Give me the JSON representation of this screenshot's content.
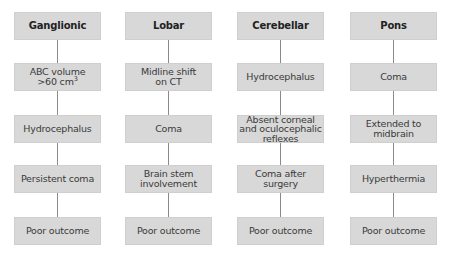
{
  "diagram": {
    "type": "flowchart",
    "columns": [
      {
        "header": "Ganglionic",
        "steps": [
          "ABC volume >60 cm³",
          "Hydrocephalus",
          "Persistent coma",
          "Poor outcome"
        ]
      },
      {
        "header": "Lobar",
        "steps": [
          "Midline shift on CT",
          "Coma",
          "Brain stem involvement",
          "Poor outcome"
        ]
      },
      {
        "header": "Cerebellar",
        "steps": [
          "Hydrocephalus",
          "Absent corneal and oculocephalic reflexes",
          "Coma after surgery",
          "Poor outcome"
        ]
      },
      {
        "header": "Pons",
        "steps": [
          "Coma",
          "Extended to midbrain",
          "Hyperthermia",
          "Poor outcome"
        ]
      }
    ],
    "colors": {
      "box_fill": "#d8d8d8",
      "connector": "#8a8a8a",
      "text": "#3a3a3a"
    }
  }
}
